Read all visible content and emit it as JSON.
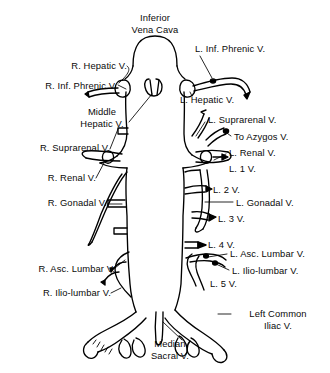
{
  "figure": {
    "title": "Inferior Vena Cava",
    "line_color": "#000000",
    "background_color": "#ffffff",
    "text_color": "#0a0a0a"
  },
  "labels": {
    "title_line1": "Inferior",
    "title_line2": "Vena Cava",
    "right_hepatic": "R. Hepatic V.",
    "right_inf_phrenic": "R. Inf. Phrenic V.",
    "middle_hepatic_line1": "Middle",
    "middle_hepatic_line2": "Hepatic V.",
    "right_suprarenal": "R. Suprarenal V.",
    "right_renal": "R. Renal V.",
    "right_gonadal": "R. Gonadal V.",
    "right_asc_lumbar": "R. Asc. Lumbar V.",
    "right_ilio_lumbar": "R. Ilio-lumbar V.",
    "left_inf_phrenic": "L. Inf. Phrenic V.",
    "left_hepatic": "L. Hepatic V.",
    "left_suprarenal": "L. Suprarenal V.",
    "to_azygos": "To Azygos V.",
    "left_renal": "L. Renal V.",
    "lumbar_1": "L. 1 V.",
    "lumbar_2": "L. 2 V.",
    "left_gonadal": "L. Gonadal V.",
    "lumbar_3": "L. 3 V.",
    "lumbar_4": "L. 4 V.",
    "left_asc_lumbar": "L. Asc. Lumbar V.",
    "left_ilio_lumbar": "L. Ilio-lumbar V.",
    "lumbar_5": "L. 5 V.",
    "left_common_iliac_line1": "Left Common",
    "left_common_iliac_line2": "Iliac V.",
    "median_sacral_line1": "Median",
    "median_sacral_line2": "Sacral V."
  }
}
